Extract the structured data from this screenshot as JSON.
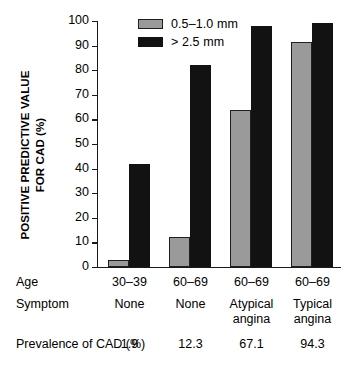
{
  "chart_data": {
    "type": "bar",
    "title": "",
    "xlabel": "",
    "ylabel": "POSITIVE PREDICTIVE VALUE FOR CAD (%)",
    "ylim": [
      0,
      100
    ],
    "ytick_labels": [
      "100",
      "90",
      "80",
      "70",
      "60",
      "50",
      "40",
      "30",
      "20",
      "10",
      "0"
    ],
    "ytick_values": [
      100,
      90,
      80,
      70,
      60,
      50,
      40,
      30,
      20,
      10,
      0
    ],
    "grid": false,
    "legend_position": "top-center",
    "categories": [
      "30-39 / None",
      "60-69 / None",
      "60-69 / Atypical angina",
      "60-69 / Typical angina"
    ],
    "series": [
      {
        "name": "0.5–1.0 mm",
        "color": "#9a9a9a",
        "values": [
          3,
          12,
          64,
          91.5
        ]
      },
      {
        "name": "> 2.5 mm",
        "color": "#121212",
        "values": [
          42,
          82,
          98,
          99
        ]
      }
    ],
    "annotations": {
      "row_labels": [
        "Age",
        "Symptom",
        "Prevalence of CAD (%)"
      ],
      "age": [
        "30–39",
        "60–69",
        "60–69",
        "60–69"
      ],
      "symptom": [
        [
          "None"
        ],
        [
          "None"
        ],
        [
          "Atypical",
          "angina"
        ],
        [
          "Typical",
          "angina"
        ]
      ],
      "prevalence": [
        "1.9",
        "12.3",
        "67.1",
        "94.3"
      ]
    }
  },
  "axis": {
    "y_title_line1": "POSITIVE PREDICTIVE VALUE",
    "y_title_line2": "FOR CAD (%)"
  },
  "legend": {
    "items": [
      {
        "label": "0.5–1.0 mm",
        "swatch": "light"
      },
      {
        "label": "> 2.5 mm",
        "swatch": "dark"
      }
    ]
  },
  "table": {
    "age_label": "Age",
    "symptom_label": "Symptom",
    "prevalence_label_line1": "Prevalence",
    "prevalence_label_line2": "of CAD (%)"
  }
}
